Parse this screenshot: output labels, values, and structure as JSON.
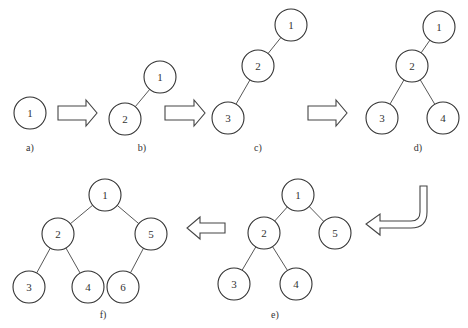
{
  "diagram": {
    "panels": [
      {
        "id": "a",
        "label": "a)",
        "nodes": [
          "1"
        ],
        "edges": []
      },
      {
        "id": "b",
        "label": "b)",
        "nodes": [
          "1",
          "2"
        ],
        "edges": [
          [
            "1",
            "2"
          ]
        ]
      },
      {
        "id": "c",
        "label": "c)",
        "nodes": [
          "1",
          "2",
          "3"
        ],
        "edges": [
          [
            "1",
            "2"
          ],
          [
            "2",
            "3"
          ]
        ]
      },
      {
        "id": "d",
        "label": "d)",
        "nodes": [
          "1",
          "2",
          "3",
          "4"
        ],
        "edges": [
          [
            "1",
            "2"
          ],
          [
            "2",
            "3"
          ],
          [
            "2",
            "4"
          ]
        ]
      },
      {
        "id": "e",
        "label": "e)",
        "nodes": [
          "1",
          "2",
          "5",
          "3",
          "4"
        ],
        "edges": [
          [
            "1",
            "2"
          ],
          [
            "1",
            "5"
          ],
          [
            "2",
            "3"
          ],
          [
            "2",
            "4"
          ]
        ]
      },
      {
        "id": "f",
        "label": "f)",
        "nodes": [
          "1",
          "2",
          "5",
          "3",
          "4",
          "6"
        ],
        "edges": [
          [
            "1",
            "2"
          ],
          [
            "1",
            "5"
          ],
          [
            "2",
            "3"
          ],
          [
            "2",
            "4"
          ],
          [
            "5",
            "6"
          ]
        ]
      }
    ],
    "arrows": [
      {
        "from": "a",
        "to": "b",
        "direction": "right"
      },
      {
        "from": "b",
        "to": "c",
        "direction": "right"
      },
      {
        "from": "c",
        "to": "d",
        "direction": "right"
      },
      {
        "from": "d",
        "to": "e",
        "direction": "down-then-left"
      },
      {
        "from": "e",
        "to": "f",
        "direction": "left"
      }
    ]
  }
}
